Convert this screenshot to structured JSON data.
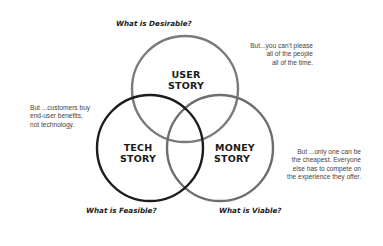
{
  "diagram": {
    "type": "venn",
    "circles": [
      {
        "id": "user",
        "label_lines": [
          "USER",
          "STORY"
        ],
        "color": "#7a7a7a"
      },
      {
        "id": "tech",
        "label_lines": [
          "TECH",
          "STORY"
        ],
        "color": "#1c1c1c"
      },
      {
        "id": "money",
        "label_lines": [
          "MONEY",
          "STORY"
        ],
        "color": "#6e6e6e"
      }
    ],
    "questions": {
      "user": "What is Desirable?",
      "tech": "What is Feasible?",
      "money": "What is Viable?"
    },
    "notes": {
      "user": [
        "But...you can't please",
        "all of the people",
        "all of the time."
      ],
      "tech": [
        "But ...customers buy",
        "end-user benefits,",
        "not technology."
      ],
      "money": [
        "But ...only one can be",
        "the cheapest. Everyone",
        "else has to compete on",
        "the experience they offer."
      ]
    }
  }
}
